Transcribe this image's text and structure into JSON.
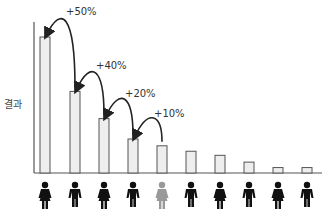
{
  "chart_data": {
    "type": "bar",
    "title": "",
    "xlabel": "",
    "ylabel": "결과",
    "categories": [
      "1",
      "2",
      "3",
      "4",
      "5",
      "6",
      "7",
      "8",
      "9",
      "10"
    ],
    "values": [
      100,
      60,
      40,
      25,
      20,
      16,
      13,
      8,
      4,
      4
    ],
    "ylim": [
      0,
      100
    ],
    "grid": false,
    "bar_fill": "#eeeeee",
    "bar_stroke": "#555555",
    "highlight_index": 4,
    "figures": [
      "female",
      "male",
      "female",
      "male",
      "female",
      "male",
      "female",
      "male",
      "female",
      "male"
    ],
    "figure_colors": {
      "default": "#111111",
      "highlight": "#999999"
    },
    "annotations": [
      {
        "from": 1,
        "to": 0,
        "label": "+50%"
      },
      {
        "from": 2,
        "to": 1,
        "label": "+40%"
      },
      {
        "from": 3,
        "to": 2,
        "label": "+20%"
      },
      {
        "from": 4,
        "to": 3,
        "label": "+10%"
      }
    ]
  }
}
